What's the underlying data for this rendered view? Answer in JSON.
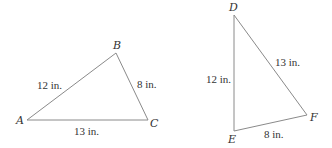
{
  "triangles": [
    {
      "name": "ABC",
      "vertices": {
        "A": "A",
        "B": "B",
        "C": "C"
      },
      "sides": {
        "AB": "12 in.",
        "BC": "8 in.",
        "AC": "13 in."
      }
    },
    {
      "name": "DEF",
      "vertices": {
        "D": "D",
        "E": "E",
        "F": "F"
      },
      "sides": {
        "DE": "12 in.",
        "DF": "13 in.",
        "EF": "8 in."
      }
    }
  ]
}
